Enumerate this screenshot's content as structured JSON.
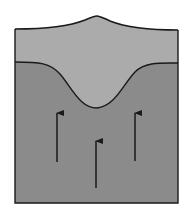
{
  "diagram": {
    "layers": [
      {
        "name": "upper-layer",
        "color": "#ababab"
      },
      {
        "name": "lower-layer",
        "color": "#8b8b8b"
      }
    ],
    "outline_color": "#1a1a1a",
    "arrows": [
      {
        "name": "left-arrow",
        "direction": "up"
      },
      {
        "name": "center-arrow",
        "direction": "up"
      },
      {
        "name": "right-arrow",
        "direction": "up"
      }
    ]
  }
}
